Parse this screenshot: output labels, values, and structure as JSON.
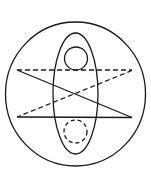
{
  "diagram": {
    "type": "geometric-line-drawing",
    "canvas": {
      "width": 151,
      "height": 179,
      "background": "#ffffff"
    },
    "stroke_color": "#1a1a1a",
    "stroke_width": 1.3,
    "dash_pattern": "5 3",
    "dot_dash_pattern": "4 3",
    "elements": {
      "outer_circle": {
        "cx": 75.5,
        "cy": 94,
        "rx": 70,
        "ry": 72,
        "style": "solid"
      },
      "inner_ellipse": {
        "cx": 75.5,
        "cy": 93.5,
        "rx": 22.5,
        "ry": 60.5,
        "style": "solid"
      },
      "top_small_circle": {
        "cx": 76,
        "cy": 58.5,
        "r": 11.5,
        "style": "solid"
      },
      "bottom_small_circle": {
        "cx": 75.5,
        "cy": 131.5,
        "r": 11.5,
        "style": "dashed"
      },
      "top_horizontal_line": {
        "x1": 17,
        "y1": 70,
        "x2": 132,
        "y2": 70,
        "style": "dashed"
      },
      "bottom_horizontal_line": {
        "x1": 17,
        "y1": 117,
        "x2": 132,
        "y2": 117.5,
        "style": "solid"
      },
      "diagonal_down": {
        "x1": 17,
        "y1": 70,
        "x2": 132,
        "y2": 117.5,
        "style": "solid"
      },
      "diagonal_up": {
        "x1": 132,
        "y1": 70.5,
        "x2": 17,
        "y2": 117,
        "style": "dashed"
      }
    }
  }
}
